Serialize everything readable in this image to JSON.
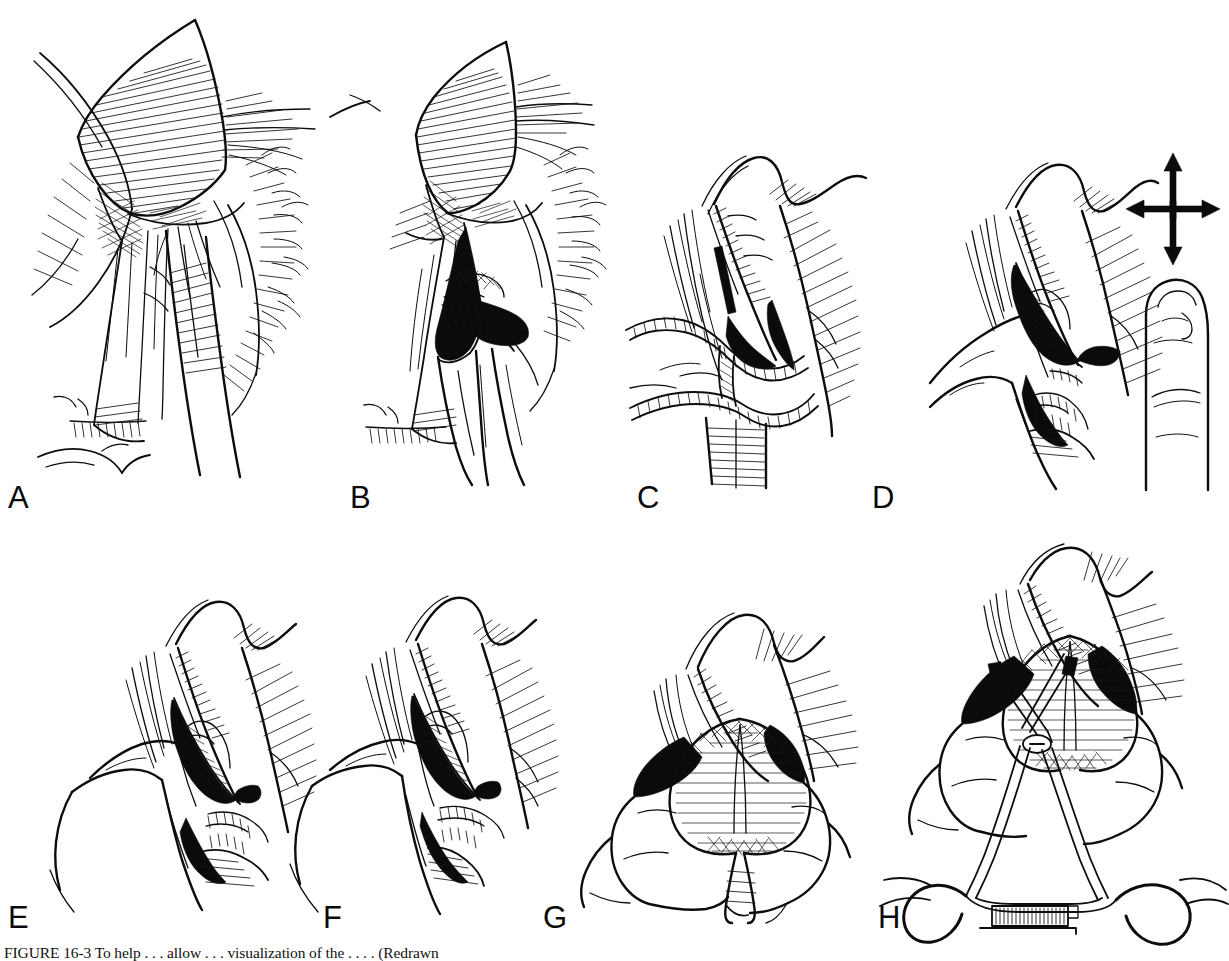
{
  "figure": {
    "type": "surgical-technique-illustration",
    "title_visible": false,
    "background_color": "#ffffff",
    "ink_color": "#0d0d0d",
    "panel_count": 8,
    "rows": 2,
    "columns": 4,
    "caption": {
      "visible_fragment": "FIGURE 16-3  To help . . . allow . . . visualization of the . . . . (Redrawn",
      "clipped": true,
      "note": "Caption text is cropped by the bottom edge of the image; only the uppermost pixel row of the glyphs is rendered."
    },
    "panels": [
      {
        "id": "A",
        "letter": "A",
        "letter_x": 8,
        "letter_y": 482,
        "subject": "retractor-blade-over-tissue-planes",
        "description": "Surgical field: a flat retractor blade with dense parallel hatching overlies fan-shaped fibrous tissue; crosshatched band of cut tissue beneath the blade; intact midline structure below.",
        "elements": [
          "retractor-blade",
          "cross-hatched-cut-edge",
          "fan-shaped-fascia",
          "midline-structure",
          "fringed-tissue-margin"
        ]
      },
      {
        "id": "B",
        "letter": "B",
        "letter_x": 350,
        "letter_y": 482,
        "subject": "blunt-finger-dissection-opening-plane",
        "description": "Same field as A with two fingers inserted spreading the tissue planes apart, revealing a dark opened cavity with crosshatched structures at its depth.",
        "elements": [
          "retractor-blade",
          "cross-hatched-cut-edge",
          "opened-dark-cavity",
          "two-fingers",
          "deep-structure"
        ]
      },
      {
        "id": "C",
        "letter": "C",
        "letter_x": 637,
        "letter_y": 482,
        "subject": "crossing-tubular-structures-over-cavity",
        "description": "Lateral view of the opening with a solid black incision mark; two striated tubular structures (vessel/duct) cross in an X over the aperture; vertical striated column below.",
        "elements": [
          "incision-mark",
          "crossing-tubular-structures",
          "striated-column",
          "sutured-edge",
          "hatched-shadow"
        ]
      },
      {
        "id": "D",
        "letter": "D",
        "letter_x": 872,
        "letter_y": 482,
        "subject": "fingertip-sweep-with-four-way-arrow",
        "description": "A finger enters the aperture from the left; beside it an isolated fingertip drawn with a four-headed directional arrow above it indicating sweeping motion in all directions.",
        "elements": [
          "inserted-finger",
          "dark-aperture",
          "isolated-fingertip",
          "four-way-arrow",
          "sutured-edge"
        ],
        "inset": {
          "name": "fingertip-motion-inset",
          "arrow": "four-way-arrow",
          "arrow_directions": [
            "up",
            "down",
            "left",
            "right"
          ]
        }
      },
      {
        "id": "E",
        "letter": "E",
        "letter_x": 8,
        "letter_y": 902,
        "subject": "finger-delivering-structure-through-aperture",
        "description": "Finger sweeping within the opened aperture; black wedge-shaped shadows frame a hatched rounded structure being eased upward.",
        "elements": [
          "inserted-finger",
          "dark-aperture",
          "hatched-structure",
          "sutured-edge",
          "hatched-shadow"
        ]
      },
      {
        "id": "F",
        "letter": "F",
        "letter_x": 323,
        "letter_y": 902,
        "subject": "structure-partially-delivered",
        "description": "Similar view to E with the rounded hatched structure advanced further out of the dark aperture; a band crosses the neck of the structure.",
        "elements": [
          "inserted-finger",
          "dark-aperture",
          "hatched-structure",
          "crossing-band",
          "sutured-edge"
        ]
      },
      {
        "id": "G",
        "letter": "G",
        "letter_x": 543,
        "letter_y": 902,
        "subject": "structure-delivered-between-two-fingers",
        "description": "Frontal view: the rounded, finely hatched structure is fully delivered and held between two fingers; black wedges of the aperture remain on either side.",
        "elements": [
          "two-fingers",
          "delivered-structure",
          "dark-aperture-wedges",
          "sutured-edge"
        ]
      },
      {
        "id": "H",
        "letter": "H",
        "letter_x": 878,
        "letter_y": 902,
        "subject": "ring-handled-clamp-applied-to-structure",
        "description": "A ring-handled crossing clamp (forceps with box lock, ratchet rack and two finger rings) is applied across the base of the delivered structure between the two fingers.",
        "elements": [
          "ring-handled-clamp",
          "clamp-jaws",
          "box-lock-screw",
          "ratchet-rack",
          "finger-rings",
          "delivered-structure",
          "two-fingers"
        ]
      }
    ]
  }
}
